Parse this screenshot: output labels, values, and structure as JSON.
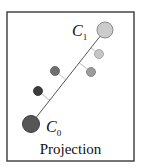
{
  "figure": {
    "caption": "Projection",
    "frame": {
      "x": 7,
      "y": 12,
      "width": 127,
      "height": 149,
      "stroke": "#3a3a3a"
    },
    "axis_line": {
      "from": [
        31,
        124
      ],
      "to": [
        105,
        30
      ],
      "color": "#555555"
    },
    "centroids": [
      {
        "id": "C0",
        "label_main": "C",
        "label_sub": "0",
        "cx": 31,
        "cy": 124,
        "r": 8.5,
        "fill": "#565656",
        "stroke": "#3d3d3d",
        "label_x": 46,
        "label_y": 132
      },
      {
        "id": "C1",
        "label_main": "C",
        "label_sub": "1",
        "cx": 105,
        "cy": 30,
        "r": 8,
        "fill": "#cbcbcb",
        "stroke": "#8a8a8a",
        "label_x": 72,
        "label_y": 36
      }
    ],
    "points": [
      {
        "cx": 99,
        "cy": 54,
        "r": 4.5,
        "fill": "#c6c6c6",
        "stroke": "#9a9a9a",
        "foot": [
          91.0,
          47.7
        ]
      },
      {
        "cx": 91,
        "cy": 72,
        "r": 4.5,
        "fill": "#9c9c9c",
        "stroke": "#7a7a7a",
        "foot": [
          79.2,
          62.7
        ]
      },
      {
        "cx": 55,
        "cy": 71,
        "r": 4.5,
        "fill": "#707070",
        "stroke": "#555555",
        "foot": [
          65.9,
          79.6
        ]
      },
      {
        "cx": 38,
        "cy": 91,
        "r": 4.5,
        "fill": "#3c3c3c",
        "stroke": "#2a2a2a",
        "foot": [
          49.7,
          100.2
        ]
      }
    ],
    "projection_line_color": "#d0d0d0"
  }
}
